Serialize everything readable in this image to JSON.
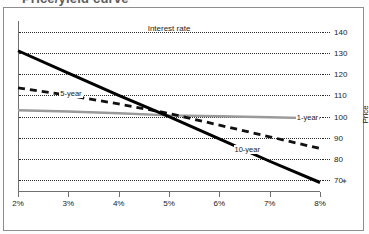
{
  "figure": {
    "title_partial": "Price/yield curve",
    "artifact_mark": "✦"
  },
  "chart_data": {
    "type": "line",
    "title": "Price/yield curve",
    "xlabel": "Interest rate",
    "ylabel": "Price",
    "x": [
      2,
      3,
      4,
      5,
      6,
      7,
      8
    ],
    "x_tick_labels": [
      "2%",
      "3%",
      "4%",
      "5%",
      "6%",
      "7%",
      "8%"
    ],
    "xlim": [
      2,
      8
    ],
    "ylim": [
      65,
      145
    ],
    "y_ticks": [
      70,
      80,
      90,
      100,
      110,
      120,
      130,
      140
    ],
    "y_tick_labels": [
      "70",
      "80",
      "90",
      "100",
      "110",
      "120",
      "130",
      "140"
    ],
    "grid": "horizontal-dotted",
    "legend": "inline-labels",
    "series": [
      {
        "name": "1-year",
        "label": "1-year",
        "color": "#9a9a9a",
        "style": "solid",
        "width": 2.4,
        "values": [
          103.0,
          102.4,
          101.6,
          100.6,
          100.2,
          99.7,
          99.2
        ]
      },
      {
        "name": "5-year",
        "label": "5-year",
        "color": "#111111",
        "style": "dashed",
        "width": 2.8,
        "values": [
          113.5,
          110.0,
          106.0,
          101.5,
          96.0,
          90.5,
          85.0
        ]
      },
      {
        "name": "10-year",
        "label": "10-year",
        "color": "#000000",
        "style": "solid",
        "width": 3.0,
        "values": [
          131.0,
          120.5,
          110.0,
          100.0,
          89.5,
          79.0,
          69.0
        ]
      }
    ]
  },
  "axis": {
    "x_title": "Interest rate",
    "y_title": "Price"
  }
}
